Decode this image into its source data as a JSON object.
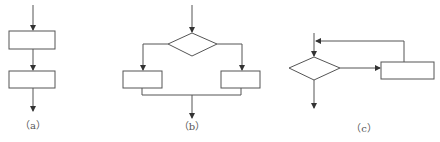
{
  "figure": {
    "panels": [
      {
        "id": "a",
        "label": "（a）",
        "structure": "sequence",
        "nodes": [
          "process-1",
          "process-2"
        ]
      },
      {
        "id": "b",
        "label": "（b）",
        "structure": "selection",
        "nodes": [
          "decision",
          "process-left",
          "process-right"
        ]
      },
      {
        "id": "c",
        "label": "（c）",
        "structure": "loop",
        "nodes": [
          "decision",
          "process"
        ]
      }
    ]
  },
  "colors": {
    "stroke": "#555555",
    "background": "#ffffff"
  }
}
